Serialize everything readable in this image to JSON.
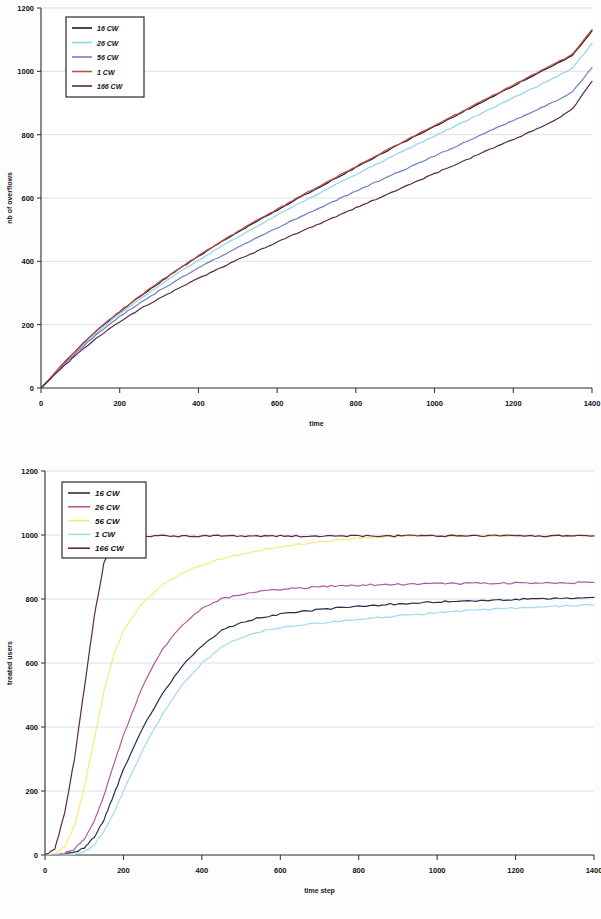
{
  "document": {
    "kind": "two-panel-scientific-figure",
    "background": "#fdfdfd"
  },
  "chart_data": [
    {
      "id": "top",
      "type": "line",
      "title": "",
      "xlabel": "time",
      "ylabel": "nb of overflows",
      "xlim": [
        0,
        1400
      ],
      "ylim": [
        0,
        1200
      ],
      "xticks": [
        0,
        200,
        400,
        600,
        800,
        1000,
        1200,
        1400
      ],
      "yticks": [
        0,
        200,
        400,
        600,
        800,
        1000,
        1200
      ],
      "grid": "horizontal",
      "legend_position": "top-left",
      "x": [
        0,
        50,
        100,
        150,
        200,
        250,
        300,
        350,
        400,
        450,
        500,
        550,
        600,
        650,
        700,
        750,
        800,
        850,
        900,
        950,
        1000,
        1050,
        1100,
        1150,
        1200,
        1250,
        1300,
        1350,
        1400
      ],
      "series": [
        {
          "name": "16 CW",
          "color": "#1a1a1a",
          "values": [
            0,
            68,
            132,
            190,
            240,
            288,
            332,
            375,
            416,
            455,
            492,
            527,
            562,
            596,
            630,
            663,
            696,
            729,
            762,
            794,
            826,
            858,
            890,
            922,
            954,
            986,
            1018,
            1050,
            1128
          ]
        },
        {
          "name": "26 CW",
          "color": "#8fd4ec",
          "values": [
            0,
            66,
            128,
            184,
            234,
            280,
            323,
            364,
            403,
            441,
            477,
            512,
            546,
            579,
            611,
            643,
            674,
            705,
            736,
            766,
            796,
            826,
            856,
            886,
            916,
            946,
            976,
            1010,
            1088
          ]
        },
        {
          "name": "56 CW",
          "color": "#6e7fc0",
          "values": [
            0,
            64,
            124,
            178,
            226,
            268,
            307,
            344,
            379,
            412,
            444,
            475,
            505,
            535,
            564,
            593,
            621,
            649,
            677,
            705,
            733,
            761,
            789,
            817,
            845,
            873,
            901,
            935,
            1012
          ]
        },
        {
          "name": "1 CW",
          "color": "#c0504d",
          "values": [
            0,
            69,
            133,
            191,
            242,
            290,
            334,
            377,
            418,
            457,
            494,
            530,
            565,
            599,
            633,
            666,
            699,
            732,
            765,
            797,
            829,
            861,
            893,
            925,
            957,
            989,
            1021,
            1053,
            1132
          ]
        },
        {
          "name": "166 CW",
          "color": "#5b2a48",
          "values": [
            0,
            60,
            116,
            166,
            210,
            248,
            282,
            315,
            346,
            376,
            405,
            433,
            461,
            488,
            515,
            542,
            569,
            596,
            623,
            650,
            677,
            704,
            731,
            758,
            785,
            812,
            841,
            880,
            968
          ]
        }
      ]
    },
    {
      "id": "bottom",
      "type": "line",
      "title": "",
      "xlabel": "time step",
      "ylabel": "treated users",
      "xlim": [
        0,
        1400
      ],
      "ylim": [
        0,
        1200
      ],
      "xticks": [
        0,
        200,
        400,
        600,
        800,
        1000,
        1200,
        1400
      ],
      "yticks": [
        0,
        200,
        400,
        600,
        800,
        1000,
        1200
      ],
      "grid": "horizontal",
      "legend_position": "top-left",
      "x": [
        0,
        25,
        50,
        75,
        100,
        125,
        150,
        175,
        200,
        250,
        300,
        350,
        400,
        450,
        500,
        550,
        600,
        650,
        700,
        750,
        800,
        850,
        900,
        950,
        1000,
        1050,
        1100,
        1150,
        1200,
        1250,
        1300,
        1350,
        1400
      ],
      "series": [
        {
          "name": "16 CW",
          "color": "#24304a",
          "values": [
            0,
            0,
            2,
            8,
            22,
            55,
            110,
            185,
            268,
            398,
            505,
            590,
            655,
            700,
            728,
            742,
            752,
            760,
            766,
            772,
            777,
            781,
            785,
            788,
            791,
            793,
            795,
            797,
            799,
            800,
            802,
            803,
            805
          ]
        },
        {
          "name": "26 CW",
          "color": "#b45aa0",
          "values": [
            0,
            1,
            5,
            18,
            48,
            105,
            185,
            280,
            375,
            530,
            645,
            720,
            770,
            800,
            815,
            824,
            830,
            834,
            838,
            841,
            843,
            845,
            846,
            847,
            848,
            848,
            849,
            849,
            850,
            850,
            851,
            851,
            852
          ]
        },
        {
          "name": "56 CW",
          "color": "#f2ec7c",
          "values": [
            0,
            4,
            26,
            90,
            210,
            360,
            510,
            625,
            700,
            790,
            845,
            880,
            905,
            925,
            940,
            952,
            962,
            970,
            978,
            985,
            990,
            994,
            996,
            997,
            997,
            997,
            997,
            997,
            997,
            997,
            997,
            997,
            997
          ]
        },
        {
          "name": "1 CW",
          "color": "#9fdcf0",
          "values": [
            0,
            0,
            0,
            2,
            10,
            32,
            72,
            130,
            200,
            330,
            440,
            530,
            600,
            648,
            680,
            698,
            710,
            718,
            724,
            730,
            736,
            742,
            747,
            752,
            757,
            761,
            765,
            769,
            772,
            775,
            777,
            779,
            781
          ]
        },
        {
          "name": "166 CW",
          "color": "#5b2a48",
          "values": [
            0,
            18,
            130,
            300,
            520,
            740,
            910,
            985,
            997,
            997,
            997,
            997,
            997,
            997,
            997,
            997,
            997,
            997,
            997,
            997,
            997,
            997,
            997,
            997,
            997,
            997,
            997,
            997,
            997,
            997,
            997,
            997,
            997
          ]
        }
      ]
    }
  ],
  "top_chart": {
    "ylabel": "nb of overflows",
    "xlabel": "time",
    "yticks": [
      "1200",
      "1000",
      "800",
      "600",
      "400",
      "200",
      "0"
    ],
    "xticks": [
      "0",
      "200",
      "400",
      "600",
      "800",
      "1000",
      "1200",
      "1400"
    ],
    "legend": [
      {
        "label": "16 CW",
        "color": "#1a1a1a"
      },
      {
        "label": "26 CW",
        "color": "#8fd4ec"
      },
      {
        "label": "56 CW",
        "color": "#6e7fc0"
      },
      {
        "label": "1 CW",
        "color": "#c0504d"
      },
      {
        "label": "166 CW",
        "color": "#5b2a48"
      }
    ]
  },
  "bottom_chart": {
    "ylabel": "treated users",
    "xlabel": "time step",
    "yticks": [
      "1200",
      "1000",
      "800",
      "600",
      "400",
      "200",
      "0"
    ],
    "xticks": [
      "0",
      "200",
      "400",
      "600",
      "800",
      "1000",
      "1200",
      "1400"
    ],
    "legend": [
      {
        "label": "16 CW",
        "color": "#24304a"
      },
      {
        "label": "26 CW",
        "color": "#b45aa0"
      },
      {
        "label": "56 CW",
        "color": "#f2ec7c"
      },
      {
        "label": "1 CW",
        "color": "#9fdcf0"
      },
      {
        "label": "166 CW",
        "color": "#5b2a48"
      }
    ]
  }
}
